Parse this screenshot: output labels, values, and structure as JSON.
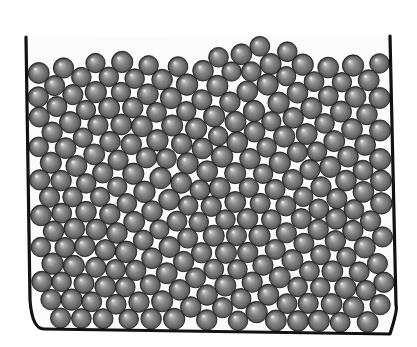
{
  "figure": {
    "width": 417,
    "height": 347,
    "background_color": "#ffffff"
  },
  "container": {
    "name": "container-vessel",
    "wall_color": "#111111",
    "wall_thickness_px": 3.2,
    "left_wall_top": {
      "x": 26,
      "y": 37
    },
    "left_wall_bottom": {
      "x": 30,
      "y": 300
    },
    "right_wall_top": {
      "x": 390,
      "y": 36
    },
    "right_wall_bottom": {
      "x": 396,
      "y": 305
    },
    "floor_left": {
      "x": 44,
      "y": 329
    },
    "floor_right": {
      "x": 390,
      "y": 334
    },
    "corner_radius_left_px": 22,
    "corner_radius_right_px": 10,
    "interior_fill": "#fbfbfb",
    "open_top": true
  },
  "grains": {
    "name": "sphere-assembly",
    "count": 498,
    "radius_px": 10.2,
    "radius_jitter_px": 0.55,
    "base_color": "#6e6e6e",
    "highlight_color": "#d8d8d8",
    "shadow_color": "#2b2b2b",
    "outline_color": "#1c1c1c",
    "outline_width_px": 0.9,
    "highlight_offset_fraction": {
      "x": -0.3,
      "y": -0.34
    },
    "highlight_radius_fraction": 0.62,
    "packing": "dense-random-close-packing",
    "interstitial_color": "#f7f7f7",
    "free_surface_label": "irregular-top-surface",
    "free_surface_y_range": [
      28,
      62
    ],
    "bed_bottom_y": 326,
    "packing_fraction_estimate": 0.84
  },
  "chart_data": {
    "type": "scatter",
    "xlabel": "",
    "ylabel": "",
    "xlim": [
      0,
      417
    ],
    "ylim": [
      0,
      347
    ],
    "grid": false,
    "legend": null,
    "series": [
      {
        "name": "spheres",
        "marker": "circle-shaded",
        "marker_size_px": 20.4,
        "color": "#6e6e6e",
        "count": 498
      },
      {
        "name": "container-walls",
        "marker": "line",
        "color": "#111111"
      }
    ],
    "annotations": []
  }
}
